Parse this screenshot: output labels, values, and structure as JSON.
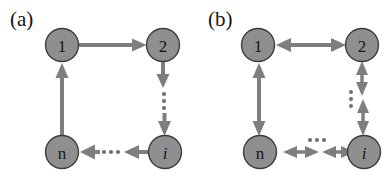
{
  "figure": {
    "width": 389,
    "height": 182,
    "background": "#ffffff",
    "node_fill": "#8f8f8f",
    "node_stroke": "#3d3d3d",
    "edge_color": "#7e7e7e",
    "text_color": "#151515",
    "node_radius": 16.5
  },
  "panels": [
    {
      "id": "panel-a",
      "label": "(a)",
      "label_x": 10,
      "label_y": 26,
      "graph_type": "directed ring",
      "nodes": [
        {
          "id": "n1",
          "label": "1",
          "x": 62,
          "y": 45,
          "italic": false
        },
        {
          "id": "n2",
          "label": "2",
          "x": 163,
          "y": 45,
          "italic": false
        },
        {
          "id": "ni",
          "label": "i",
          "x": 165,
          "y": 152,
          "italic": true
        },
        {
          "id": "nn",
          "label": "n",
          "x": 62,
          "y": 152,
          "italic": false
        }
      ],
      "edges": [
        {
          "from": "n1",
          "to": "n2",
          "direction": "one-way",
          "orientation": "horizontal",
          "dotted_gap": false
        },
        {
          "from": "n2",
          "to": "ni",
          "direction": "one-way",
          "orientation": "vertical",
          "dotted_gap": true
        },
        {
          "from": "ni",
          "to": "nn",
          "direction": "one-way",
          "orientation": "horizontal",
          "dotted_gap": true
        },
        {
          "from": "nn",
          "to": "n1",
          "direction": "one-way",
          "orientation": "vertical",
          "dotted_gap": false
        }
      ]
    },
    {
      "id": "panel-b",
      "label": "(b)",
      "label_x": 208,
      "label_y": 26,
      "graph_type": "undirected ring",
      "nodes": [
        {
          "id": "n1",
          "label": "1",
          "x": 258,
          "y": 45,
          "italic": false
        },
        {
          "id": "n2",
          "label": "2",
          "x": 362,
          "y": 45,
          "italic": false
        },
        {
          "id": "ni",
          "label": "i",
          "x": 364,
          "y": 152,
          "italic": true
        },
        {
          "id": "nn",
          "label": "n",
          "x": 260,
          "y": 152,
          "italic": false
        }
      ],
      "edges": [
        {
          "from": "n1",
          "to": "n2",
          "direction": "two-way",
          "orientation": "horizontal",
          "dotted_gap": false
        },
        {
          "from": "n2",
          "to": "ni",
          "direction": "two-way",
          "orientation": "vertical",
          "dotted_gap": true
        },
        {
          "from": "ni",
          "to": "nn",
          "direction": "two-way",
          "orientation": "horizontal",
          "dotted_gap": true
        },
        {
          "from": "nn",
          "to": "n1",
          "direction": "two-way",
          "orientation": "vertical",
          "dotted_gap": false
        }
      ]
    }
  ]
}
